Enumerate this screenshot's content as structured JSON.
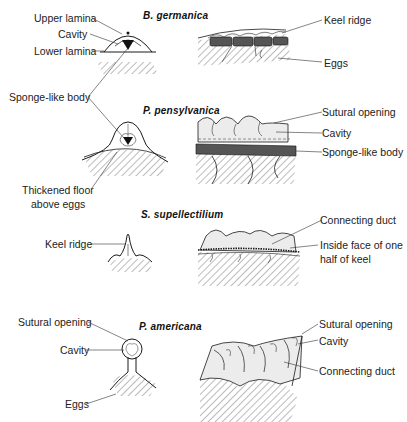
{
  "figure": {
    "panels": [
      {
        "species": "B. germanica",
        "labels": {
          "upper_lamina": "Upper lamina",
          "cavity": "Cavity",
          "lower_lamina": "Lower lamina",
          "sponge_like_body": "Sponge-like body",
          "keel_ridge": "Keel ridge",
          "eggs": "Eggs"
        }
      },
      {
        "species": "P. pensylvanica",
        "labels": {
          "thickened_floor_line1": "Thickened floor",
          "thickened_floor_line2": "above eggs",
          "sutural_opening": "Sutural opening",
          "cavity": "Cavity",
          "sponge_like_body": "Sponge-like body"
        }
      },
      {
        "species": "S. supellectilium",
        "labels": {
          "keel_ridge": "Keel ridge",
          "connecting_duct": "Connecting duct",
          "inside_face_line1": "Inside face of one",
          "inside_face_line2": "half of keel"
        }
      },
      {
        "species": "P. americana",
        "labels": {
          "sutural_opening_left": "Sutural opening",
          "cavity_left": "Cavity",
          "eggs": "Eggs",
          "sutural_opening_right": "Sutural opening",
          "cavity_right": "Cavity",
          "connecting_duct": "Connecting duct"
        }
      }
    ]
  },
  "colors": {
    "ink": "#1a1a1a",
    "sponge_fill": "#555555",
    "shade": "#e6e6e6"
  }
}
